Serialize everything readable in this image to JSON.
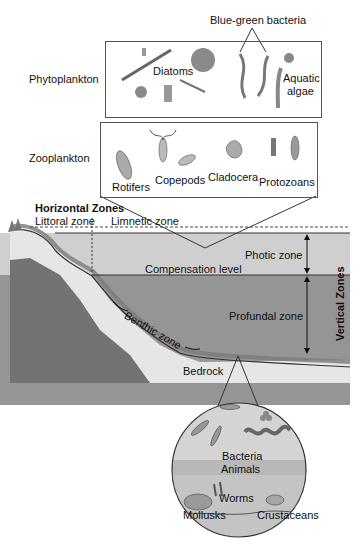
{
  "diagram": {
    "phytoplankton": {
      "label": "Phytoplankton",
      "items": [
        "Diatoms",
        "Aquatic algae"
      ],
      "top_label": "Blue-green bacteria",
      "aquatic_line1": "Aquatic",
      "aquatic_line2": "algae"
    },
    "zooplankton": {
      "label": "Zooplankton",
      "items": [
        "Rotifers",
        "Copepods",
        "Cladocera",
        "Protozoans"
      ]
    },
    "horizontal_zones": {
      "heading": "Horizontal Zones",
      "items": [
        "Littoral zone",
        "Limnetic zone"
      ]
    },
    "vertical_zones": {
      "heading": "Vertical Zones",
      "items": [
        "Photic zone",
        "Profundal zone"
      ]
    },
    "levels": {
      "compensation": "Compensation level",
      "benthic": "Benthic zone",
      "bedrock": "Bedrock"
    },
    "benthic_detail": {
      "items": [
        "Bacteria",
        "Animals",
        "Worms",
        "Mollusks",
        "Crustaceans"
      ]
    },
    "colors": {
      "box_fill": "#d9d9d9",
      "photic": "#c8c8c8",
      "profundal": "#8e8e8e",
      "sediment": "#e4e4e4",
      "rock": "#6f6f6f"
    }
  }
}
